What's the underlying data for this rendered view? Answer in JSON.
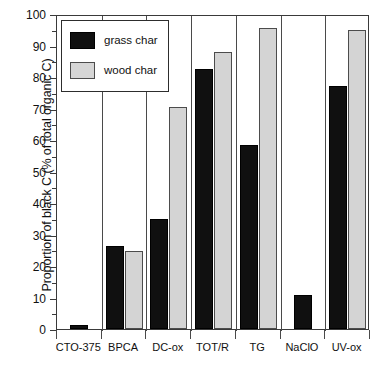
{
  "chart_data": {
    "type": "bar",
    "title": "",
    "xlabel": "",
    "ylabel": "Proportion of black C (% of total organic C)",
    "ylim": [
      0,
      100
    ],
    "ytick_step": 10,
    "ytick_labels": [
      "0",
      "10",
      "20",
      "30",
      "40",
      "50",
      "60",
      "70",
      "80",
      "90",
      "100"
    ],
    "grid": false,
    "legend_position": "top-left",
    "categories": [
      "CTO-375",
      "BPCA",
      "DC-ox",
      "TOT/R",
      "TG",
      "NaClO",
      "UV-ox"
    ],
    "series": [
      {
        "name": "grass char",
        "color": "#101010",
        "values": [
          1.3,
          26.3,
          35.0,
          82.5,
          58.4,
          10.8,
          77.2
        ]
      },
      {
        "name": "wood char",
        "color": "#d4d4d4",
        "values": [
          null,
          24.8,
          70.5,
          88.0,
          95.5,
          null,
          95.0
        ]
      }
    ]
  },
  "legend": {
    "entries": [
      {
        "label": "grass char"
      },
      {
        "label": "wood char"
      }
    ]
  },
  "axis": {
    "y_title": "Proportion of black C (% of total organic C)"
  }
}
